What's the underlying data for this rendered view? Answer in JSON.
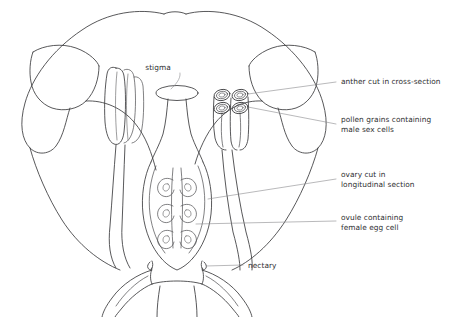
{
  "diagram": {
    "background_color": "#ffffff",
    "ink_color": "#3a3a3c",
    "leader_color": "#8a8a8d",
    "text_color": "#2e2e30"
  },
  "labels": {
    "stigma": {
      "text": "stigma",
      "lines": [
        "stigma"
      ]
    },
    "anther": {
      "text": "anther cut in cross-section",
      "lines": [
        "anther cut in cross-section"
      ]
    },
    "pollen": {
      "text": "pollen grains containing male sex cells",
      "lines": [
        "pollen grains containing",
        "male sex cells"
      ]
    },
    "ovary": {
      "text": "ovary cut in longitudinal section",
      "lines": [
        "ovary cut in",
        "longitudinal section"
      ]
    },
    "ovule": {
      "text": "ovule containing female egg cell",
      "lines": [
        "ovule containing",
        "female egg cell"
      ]
    },
    "nectary": {
      "text": "nectary",
      "lines": [
        "nectary"
      ]
    }
  },
  "structures": {
    "petal_left": "petal-left",
    "petal_right": "petal-right",
    "stamen_left": "stamen-side-view",
    "stamen_right": "stamen-cross-section",
    "pistil": "pistil",
    "ovule_count": 6,
    "pollen_sac_count": 4,
    "sepal_left": "sepal-left",
    "sepal_right": "sepal-right"
  }
}
